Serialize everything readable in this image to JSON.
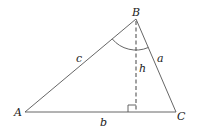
{
  "diagram": {
    "type": "triangle-with-altitude",
    "colors": {
      "stroke": "#555555",
      "text": "#222222",
      "background": "#ffffff"
    },
    "vertices": {
      "A": {
        "label": "A",
        "x": 25,
        "y": 112
      },
      "B": {
        "label": "B",
        "x": 136,
        "y": 19
      },
      "C": {
        "label": "C",
        "x": 176,
        "y": 112
      }
    },
    "sides": {
      "a": {
        "label": "a",
        "between": "B-C"
      },
      "b": {
        "label": "b",
        "between": "A-C"
      },
      "c": {
        "label": "c",
        "between": "A-B"
      }
    },
    "altitude": {
      "label": "h",
      "from": "B",
      "foot_x": 136,
      "foot_y": 112,
      "style": "dashed"
    },
    "angle_marker": {
      "vertex": "B",
      "radius": 31
    },
    "right_angle_marker": {
      "at": "foot",
      "size": 7
    }
  }
}
